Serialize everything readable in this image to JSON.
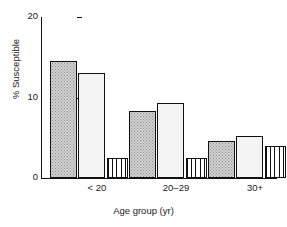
{
  "chart_data": {
    "type": "bar",
    "title": "",
    "xlabel": "Age group (yr)",
    "ylabel": "% Susceptible",
    "categories": [
      "< 20",
      "20–29",
      "30+"
    ],
    "ylim": [
      0,
      20
    ],
    "yticks": [
      0,
      10,
      20
    ],
    "ytick_labels": [
      "0",
      "10",
      "20"
    ],
    "grid": false,
    "legend": "none",
    "series": [
      {
        "name": "series-1",
        "pattern": "dense-stipple",
        "values": [
          14.5,
          8.3,
          4.6
        ]
      },
      {
        "name": "series-2",
        "pattern": "light-stipple",
        "values": [
          13.1,
          9.3,
          5.2
        ]
      },
      {
        "name": "series-3",
        "pattern": "vertical-lines",
        "values": [
          2.5,
          2.5,
          4.0
        ]
      }
    ]
  },
  "axes": {
    "y": {
      "label": "% Susceptible",
      "ticks": [
        {
          "value": 20,
          "label": "20"
        },
        {
          "value": 10,
          "label": "10"
        },
        {
          "value": 0,
          "label": "0"
        }
      ]
    },
    "x": {
      "label": "Age group (yr)",
      "ticks": [
        {
          "label": "< 20"
        },
        {
          "label": "20–29"
        },
        {
          "label": "30+"
        }
      ]
    }
  },
  "bars": [
    {
      "group": "< 20",
      "series": "series-1",
      "value": 14.5,
      "pattern": "dense-stipple",
      "x": 9,
      "w": 27
    },
    {
      "group": "< 20",
      "series": "series-2",
      "value": 13.1,
      "pattern": "light-stipple",
      "x": 37,
      "w": 27
    },
    {
      "group": "< 20",
      "series": "series-3",
      "value": 2.5,
      "pattern": "vertical-lines",
      "x": 66,
      "w": 21
    },
    {
      "group": "20–29",
      "series": "series-1",
      "value": 8.3,
      "pattern": "dense-stipple",
      "x": 88,
      "w": 27
    },
    {
      "group": "20–29",
      "series": "series-2",
      "value": 9.3,
      "pattern": "light-stipple",
      "x": 116,
      "w": 27
    },
    {
      "group": "20–29",
      "series": "series-3",
      "value": 2.5,
      "pattern": "vertical-lines",
      "x": 145,
      "w": 21
    },
    {
      "group": "30+",
      "series": "series-1",
      "value": 4.6,
      "pattern": "dense-stipple",
      "x": 167,
      "w": 27
    },
    {
      "group": "30+",
      "series": "series-2",
      "value": 5.2,
      "pattern": "light-stipple",
      "x": 195,
      "w": 27
    },
    {
      "group": "30+",
      "series": "series-3",
      "value": 4.0,
      "pattern": "vertical-lines",
      "x": 224,
      "w": 21
    }
  ],
  "group_label_x": [
    56,
    135,
    214
  ]
}
